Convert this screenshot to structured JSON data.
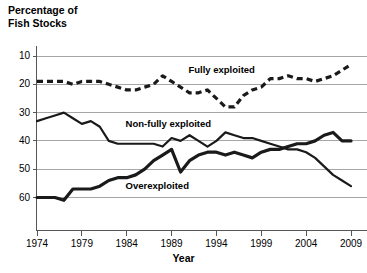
{
  "chart_data": {
    "type": "line",
    "title": "",
    "ylabel": "Percentage of\nFish Stocks",
    "xlabel": "Year",
    "x": [
      1974,
      1975,
      1976,
      1977,
      1978,
      1979,
      1980,
      1981,
      1982,
      1983,
      1984,
      1985,
      1986,
      1987,
      1988,
      1989,
      1990,
      1991,
      1992,
      1993,
      1994,
      1995,
      1996,
      1997,
      1998,
      1999,
      2000,
      2001,
      2002,
      2003,
      2004,
      2005,
      2006,
      2007,
      2008,
      2009
    ],
    "xlim": [
      1974,
      2009
    ],
    "ylim": [
      5,
      62
    ],
    "yticks": [
      10,
      20,
      30,
      40,
      50,
      60
    ],
    "xticks": [
      1974,
      1979,
      1984,
      1989,
      1994,
      1999,
      2004,
      2009
    ],
    "grid": true,
    "legend": "inline-annotations",
    "series": [
      {
        "name": "Fully exploited",
        "style": "dashed",
        "color": "#1a1a1a",
        "label_x": 1995,
        "label_y": 55,
        "values": [
          51,
          51,
          51,
          51,
          50,
          51,
          51,
          51,
          50,
          49,
          48,
          48,
          49,
          50,
          53,
          51,
          49,
          47,
          47,
          48,
          45,
          42,
          42,
          46,
          48,
          49,
          52,
          52,
          53,
          52,
          52,
          51,
          52,
          53,
          55,
          57
        ]
      },
      {
        "name": "Non-fully exploited",
        "style": "solid",
        "color": "#1a1a1a",
        "label_x": 1988,
        "label_y": 36,
        "values": [
          37,
          38,
          39,
          40,
          38,
          36,
          37,
          35,
          30,
          29,
          29,
          29,
          29,
          29,
          28,
          31,
          30,
          32,
          30,
          28,
          30,
          33,
          32,
          31,
          31,
          30,
          29,
          28,
          27,
          27,
          26,
          24,
          21,
          18,
          16,
          14
        ]
      },
      {
        "name": "Overexploited",
        "style": "solid-thick",
        "color": "#1a1a1a",
        "label_x": 1988,
        "label_y": 14,
        "values": [
          10,
          10,
          10,
          9,
          13,
          13,
          13,
          14,
          16,
          17,
          17,
          18,
          20,
          23,
          25,
          27,
          19,
          23,
          25,
          26,
          26,
          25,
          26,
          25,
          24,
          26,
          27,
          27,
          28,
          29,
          29,
          30,
          32,
          33,
          30,
          30
        ]
      }
    ]
  },
  "axes": {
    "y_title_line1": "Percentage of",
    "y_title_line2": "Fish Stocks",
    "x_title": "Year",
    "y_tick_labels": [
      "60",
      "50",
      "40",
      "30",
      "20",
      "10"
    ],
    "x_tick_labels": [
      "1974",
      "1979",
      "1984",
      "1989",
      "1994",
      "1999",
      "2004",
      "2009"
    ]
  },
  "annotations": {
    "fully_exploited": "Fully exploited",
    "non_fully_exploited": "Non-fully exploited",
    "overexploited": "Overexploited"
  },
  "colors": {
    "line": "#1a1a1a",
    "grid": "#a6a6a6",
    "axis": "#555555",
    "background": "#ffffff"
  }
}
